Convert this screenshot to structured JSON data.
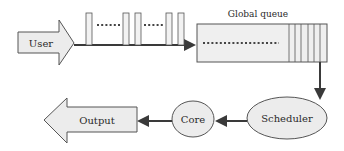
{
  "diagram": {
    "type": "flow",
    "nodes": {
      "user": {
        "label": "User",
        "shape": "right-arrow"
      },
      "global_queue": {
        "label": "Global queue",
        "shape": "queue-box",
        "slots": 6
      },
      "scheduler": {
        "label": "Scheduler",
        "shape": "ellipse"
      },
      "core": {
        "label": "Core",
        "shape": "ellipse"
      },
      "output": {
        "label": "Output",
        "shape": "left-arrow"
      }
    },
    "task_stream": {
      "task_bars": 5,
      "gaps_dotted": 2
    },
    "edges": [
      {
        "from": "user",
        "to": "global_queue",
        "via": "task stream"
      },
      {
        "from": "global_queue",
        "to": "scheduler"
      },
      {
        "from": "scheduler",
        "to": "core"
      },
      {
        "from": "core",
        "to": "output"
      }
    ],
    "colors": {
      "fill": "#ececec",
      "stroke": "#555555",
      "line": "#3a3a3a",
      "dots": "#444444"
    }
  }
}
